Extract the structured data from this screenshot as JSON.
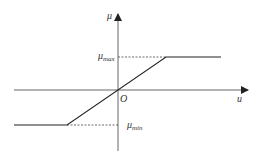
{
  "diagram": {
    "type": "saturation-function",
    "axes": {
      "x_label": "u",
      "y_label": "μ",
      "origin_label": "O"
    },
    "levels": {
      "max_label": "μ",
      "max_sub": "max",
      "min_label": "μ",
      "min_sub": "min"
    },
    "colors": {
      "axis": "#555555",
      "curve": "#222222",
      "dashed": "#444444"
    }
  }
}
